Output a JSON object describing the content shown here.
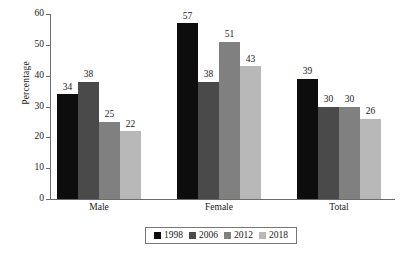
{
  "chart_data": {
    "type": "bar",
    "title": "",
    "subtitle": "",
    "xlabel": "",
    "ylabel": "Percentage",
    "ylim": [
      0,
      60
    ],
    "yticks": [
      0,
      10,
      20,
      30,
      40,
      50,
      60
    ],
    "ytick_labels": [
      "0",
      "10",
      "20",
      "30",
      "40",
      "50",
      "60"
    ],
    "grid": false,
    "legend_position": "bottom-center",
    "categories": [
      "Male",
      "Female",
      "Total"
    ],
    "series": [
      {
        "name": "1998",
        "color": "#0d0d0d",
        "values": [
          34,
          57,
          39
        ]
      },
      {
        "name": "2006",
        "color": "#4a4a4a",
        "values": [
          38,
          38,
          30
        ]
      },
      {
        "name": "2012",
        "color": "#808080",
        "values": [
          25,
          51,
          30
        ]
      },
      {
        "name": "2018",
        "color": "#b8b8b8",
        "values": [
          22,
          43,
          26
        ]
      }
    ],
    "data_labels": [
      [
        "34",
        "38",
        "25",
        "22"
      ],
      [
        "57",
        "38",
        "51",
        "43"
      ],
      [
        "39",
        "30",
        "30",
        "26"
      ]
    ],
    "annotations": []
  }
}
